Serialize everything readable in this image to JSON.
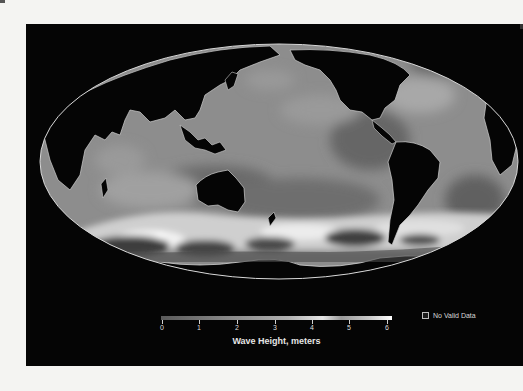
{
  "map": {
    "projection": "Mollweide (Pacific-centered)",
    "colors": {
      "background_panel": "#050505",
      "land": "#050505",
      "coastline": "#d8d8d8",
      "ocean_low": "#5a5a5a",
      "ocean_mid": "#8a8a8a",
      "ocean_high": "#cfcfcf",
      "ocean_max": "#ffffff",
      "page_background": "#f4f4f2"
    }
  },
  "colorbar": {
    "title": "Wave Height, meters",
    "ticks": [
      "0",
      "1",
      "2",
      "3",
      "4",
      "5",
      "6"
    ],
    "min": 0,
    "max": 6
  },
  "legend": {
    "no_data_label": "No Valid Data"
  }
}
